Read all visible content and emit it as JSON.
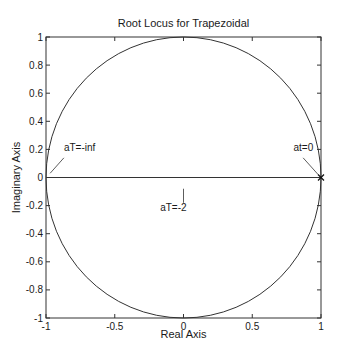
{
  "chart_data": {
    "type": "line",
    "title": "Root Locus for Trapezoidal",
    "xlabel": "Real Axis",
    "ylabel": "Imaginary Axis",
    "xlim": [
      -1,
      1
    ],
    "ylim": [
      -1,
      1
    ],
    "grid": false,
    "x_ticks": [
      -1,
      -0.5,
      0,
      0.5,
      1
    ],
    "x_tick_labels": [
      "-1",
      "-0.5",
      "0",
      "0.5",
      "1"
    ],
    "y_ticks": [
      -1,
      -0.8,
      -0.6,
      -0.4,
      -0.2,
      0,
      0.2,
      0.4,
      0.6,
      0.8,
      1
    ],
    "y_tick_labels": [
      "-1",
      "-0.8",
      "-0.6",
      "-0.4",
      "-0.2",
      "0",
      "0.2",
      "0.4",
      "0.6",
      "0.8",
      "1"
    ],
    "series": [
      {
        "name": "unit-circle-locus",
        "shape": "circle",
        "center": [
          0,
          0
        ],
        "radius": 1
      },
      {
        "name": "real-axis-locus",
        "x": [
          -1,
          1
        ],
        "y": [
          0,
          0
        ]
      }
    ],
    "markers": [
      {
        "name": "pole-at-zero",
        "symbol": "x",
        "x": 1,
        "y": 0
      }
    ],
    "annotations": [
      {
        "text": "aT=-inf",
        "x": -0.87,
        "y": 0.19,
        "pointer_from": [
          -0.87,
          0.14
        ],
        "pointer_to": [
          -0.97,
          0.03
        ]
      },
      {
        "text": "at=0",
        "x": 0.8,
        "y": 0.19,
        "pointer_from": [
          0.87,
          0.14
        ],
        "pointer_to": [
          0.98,
          0.02
        ]
      },
      {
        "text": "aT=-2",
        "x": -0.17,
        "y": -0.24,
        "pointer_from": [
          0,
          -0.08
        ],
        "pointer_to": [
          0,
          -0.18
        ]
      }
    ]
  }
}
